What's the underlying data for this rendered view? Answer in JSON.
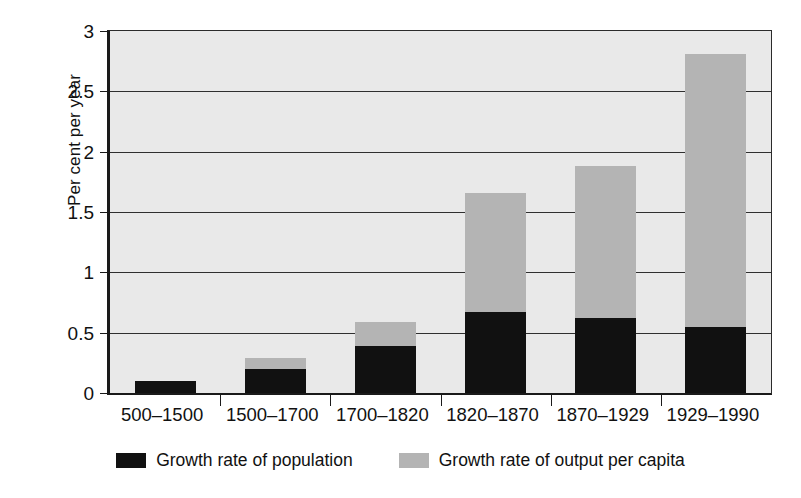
{
  "chart_data": {
    "type": "bar",
    "subtype": "stacked-bar",
    "title": "",
    "xlabel": "",
    "ylabel": "Per cent per year",
    "categories": [
      "500–1500",
      "1500–1700",
      "1700–1820",
      "1820–1870",
      "1870–1929",
      "1929–1990"
    ],
    "series": [
      {
        "name": "Growth rate of population",
        "color": "#111111",
        "values": [
          0.1,
          0.2,
          0.39,
          0.67,
          0.62,
          0.55
        ]
      },
      {
        "name": "Growth rate of output per capita",
        "color": "#b4b4b4",
        "values": [
          0.0,
          0.09,
          0.2,
          0.99,
          1.26,
          2.26
        ]
      }
    ],
    "totals": [
      0.1,
      0.29,
      0.59,
      1.66,
      1.88,
      2.81
    ],
    "ylim": [
      0,
      3
    ],
    "ytick_labels": [
      "0",
      "0.5",
      "1",
      "1.5",
      "2",
      "2.5",
      "3"
    ],
    "ytick_values": [
      0,
      0.5,
      1,
      1.5,
      2,
      2.5,
      3
    ],
    "grid": true,
    "legend_position": "bottom",
    "plot_background": "#e9e9e9"
  },
  "legend": {
    "items": [
      {
        "label": "Growth rate of population",
        "swatch": "black-swatch-icon"
      },
      {
        "label": "Growth rate of output per capita",
        "swatch": "gray-swatch-icon"
      }
    ]
  }
}
